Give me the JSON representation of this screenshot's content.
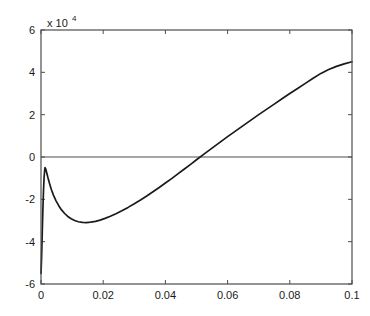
{
  "chart_data": {
    "type": "line",
    "title": "",
    "xlabel": "",
    "ylabel": "",
    "y_multiplier_label": "x 10",
    "y_multiplier_exponent": "4",
    "y_scale_factor": 10000,
    "xlim": [
      0,
      0.1
    ],
    "ylim": [
      -60000,
      60000
    ],
    "xticks": [
      0,
      0.02,
      0.04,
      0.06,
      0.08,
      0.1
    ],
    "xtick_labels": [
      "0",
      "0.02",
      "0.04",
      "0.06",
      "0.08",
      "0.1"
    ],
    "yticks": [
      -60000,
      -40000,
      -20000,
      0,
      20000,
      40000,
      60000
    ],
    "ytick_labels": [
      "-6",
      "-4",
      "-2",
      "0",
      "2",
      "4",
      "6"
    ],
    "grid": false,
    "legend": null,
    "box": true,
    "tick_direction": "in",
    "zero_reference_line": true,
    "line_color": "#1a1a1a",
    "axis_color": "#4d4d4d",
    "background_color": "#ffffff",
    "series": [
      {
        "name": "signal",
        "points": [
          [
            0.0,
            -55000
          ],
          [
            0.0002,
            -47000
          ],
          [
            0.0004,
            -36000
          ],
          [
            0.0006,
            -25000
          ],
          [
            0.0008,
            -16000
          ],
          [
            0.001,
            -9500
          ],
          [
            0.0012,
            -6000
          ],
          [
            0.0013,
            -5000
          ],
          [
            0.0015,
            -5600
          ],
          [
            0.0018,
            -7200
          ],
          [
            0.0022,
            -9600
          ],
          [
            0.0027,
            -12300
          ],
          [
            0.0033,
            -15200
          ],
          [
            0.004,
            -18000
          ],
          [
            0.0048,
            -20600
          ],
          [
            0.0057,
            -23000
          ],
          [
            0.0066,
            -25000
          ],
          [
            0.0076,
            -26700
          ],
          [
            0.0086,
            -28100
          ],
          [
            0.0097,
            -29200
          ],
          [
            0.0108,
            -30000
          ],
          [
            0.012,
            -30600
          ],
          [
            0.0133,
            -30900
          ],
          [
            0.0146,
            -31000
          ],
          [
            0.016,
            -30800
          ],
          [
            0.0175,
            -30400
          ],
          [
            0.019,
            -29800
          ],
          [
            0.0206,
            -29000
          ],
          [
            0.0223,
            -28000
          ],
          [
            0.0241,
            -26800
          ],
          [
            0.026,
            -25400
          ],
          [
            0.028,
            -23800
          ],
          [
            0.03,
            -22100
          ],
          [
            0.032,
            -20300
          ],
          [
            0.034,
            -18400
          ],
          [
            0.036,
            -16400
          ],
          [
            0.038,
            -14400
          ],
          [
            0.04,
            -12300
          ],
          [
            0.042,
            -10200
          ],
          [
            0.044,
            -8000
          ],
          [
            0.046,
            -5800
          ],
          [
            0.048,
            -3600
          ],
          [
            0.05,
            -1300
          ],
          [
            0.0525,
            1500
          ],
          [
            0.055,
            4200
          ],
          [
            0.0575,
            6900
          ],
          [
            0.06,
            9600
          ],
          [
            0.0625,
            12200
          ],
          [
            0.065,
            14800
          ],
          [
            0.0675,
            17400
          ],
          [
            0.07,
            20000
          ],
          [
            0.0725,
            22500
          ],
          [
            0.075,
            25000
          ],
          [
            0.0775,
            27500
          ],
          [
            0.08,
            30000
          ],
          [
            0.0825,
            32400
          ],
          [
            0.085,
            34800
          ],
          [
            0.0875,
            37200
          ],
          [
            0.09,
            39500
          ],
          [
            0.0925,
            41300
          ],
          [
            0.095,
            42800
          ],
          [
            0.0975,
            44000
          ],
          [
            0.1,
            45000
          ]
        ]
      }
    ],
    "annotations": [
      {
        "name": "local-peak",
        "x": 0.0013,
        "y": -5000,
        "description": "sharp initial spike peak"
      },
      {
        "name": "local-minimum",
        "x": 0.0146,
        "y": -31000,
        "description": "trough after spike decay"
      },
      {
        "name": "zero-crossing",
        "x": 0.0525,
        "y": 0,
        "description": "curve crosses zero axis"
      }
    ]
  }
}
